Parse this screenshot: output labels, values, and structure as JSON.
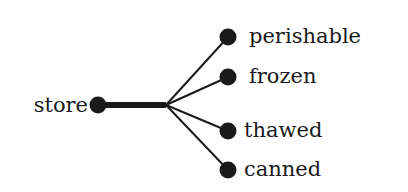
{
  "diagram": {
    "type": "tree",
    "root": {
      "label": "store",
      "x": 98,
      "y": 105
    },
    "stem_end": {
      "x": 166,
      "y": 105
    },
    "children": [
      {
        "label": "perishable",
        "x": 228,
        "y": 37
      },
      {
        "label": "frozen",
        "x": 228,
        "y": 77
      },
      {
        "label": "thawed",
        "x": 228,
        "y": 131
      },
      {
        "label": "canned",
        "x": 228,
        "y": 170
      }
    ],
    "colors": {
      "ink": "#1a1a1a",
      "background": "#ffffff"
    }
  }
}
